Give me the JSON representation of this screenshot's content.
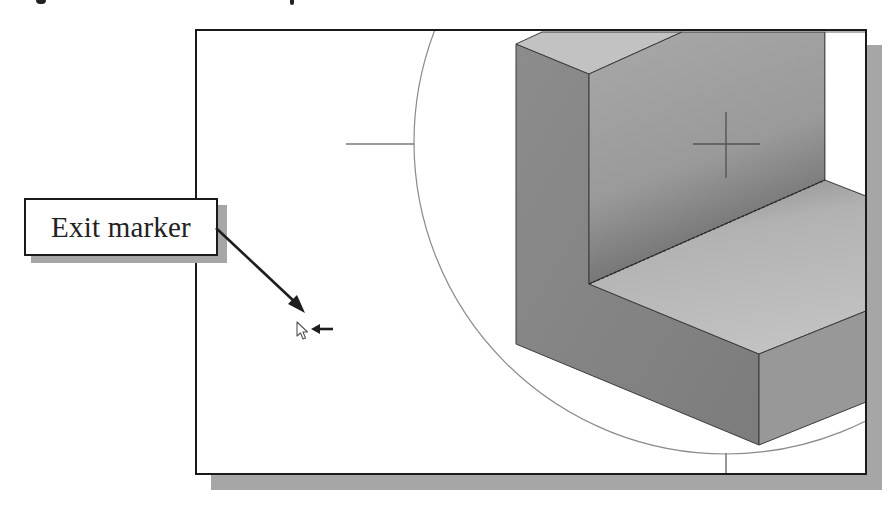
{
  "figure": {
    "callout": {
      "label": "Exit marker"
    },
    "viewport": {
      "background": "#ffffff",
      "border_color": "#1a1a1a",
      "shadow_color": "#a6a6a6"
    },
    "model": {
      "description": "Isometric L-shaped block",
      "faces": {
        "top_face": "#c2c2c2",
        "left_face": "#878787",
        "inner_wall": "#9c9c9c",
        "floor": "#b9b9b9",
        "front_face": "#818181",
        "right_face": "#9a9a9a"
      }
    },
    "view_rotation_circle": {
      "center": [
        724,
        140
      ],
      "radius": 312
    },
    "cursor": {
      "icon": "arrow-cursor-icon",
      "position": [
        297,
        322
      ]
    },
    "pointer_arrow": {
      "icon": "left-arrow-icon"
    }
  }
}
